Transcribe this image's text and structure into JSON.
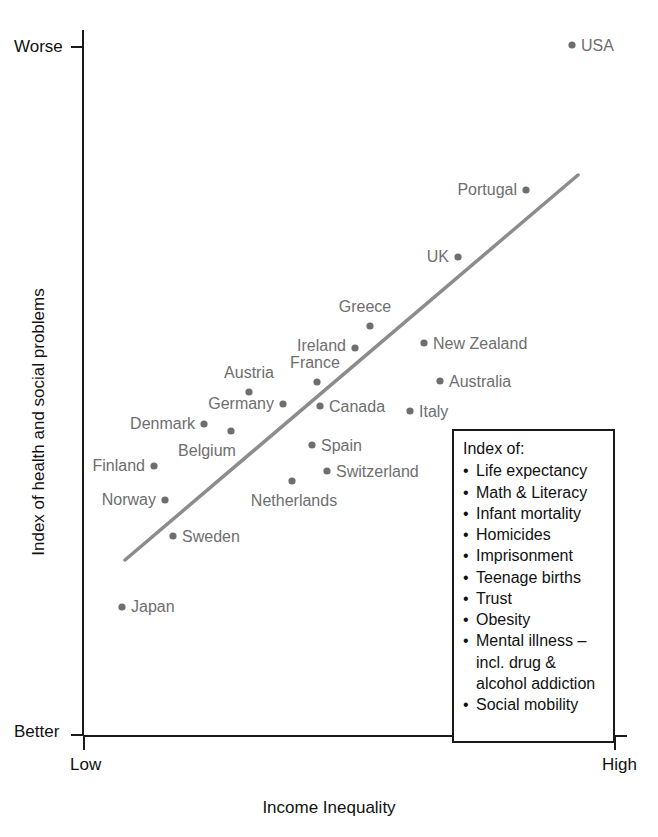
{
  "chart_data": {
    "type": "scatter",
    "title": "",
    "xlabel": "Income Inequality",
    "ylabel": "Index of health and social problems",
    "x_tick_labels": [
      "Low",
      "High"
    ],
    "y_tick_labels": [
      "Worse",
      "Better"
    ],
    "y_axis_top_label": "Worse",
    "y_axis_bottom_label": "Better",
    "grid": false,
    "legend_position": "inside-bottom-right",
    "point_color": "#6e6e6e",
    "trendline_color": "#8c8c8c",
    "axis_color": "#1a1a1a",
    "xlim": [
      0,
      1
    ],
    "ylim": [
      0,
      1
    ],
    "points": [
      {
        "name": "Japan",
        "x": 0.075,
        "y": 0.155,
        "px": 122,
        "py": 607,
        "label_anchor": "start",
        "label_dx": 9,
        "label_dy": 0
      },
      {
        "name": "Sweden",
        "x": 0.169,
        "y": 0.259,
        "px": 173,
        "py": 536,
        "label_anchor": "start",
        "label_dx": 9,
        "label_dy": 1
      },
      {
        "name": "Norway",
        "x": 0.153,
        "y": 0.312,
        "px": 165,
        "py": 500,
        "label_anchor": "end",
        "label_dx": -9,
        "label_dy": 0
      },
      {
        "name": "Finland",
        "x": 0.133,
        "y": 0.362,
        "px": 154,
        "py": 466,
        "label_anchor": "end",
        "label_dx": -9,
        "label_dy": 0
      },
      {
        "name": "Netherlands",
        "x": 0.389,
        "y": 0.34,
        "px": 292,
        "py": 481,
        "label_anchor": "middle",
        "label_dx": 2,
        "label_dy": 20
      },
      {
        "name": "Belgium",
        "x": 0.279,
        "y": 0.433,
        "px": 231,
        "py": 431,
        "label_anchor": "middle",
        "label_dx": -24,
        "label_dy": 20
      },
      {
        "name": "Denmark",
        "x": 0.229,
        "y": 0.443,
        "px": 204,
        "py": 424,
        "label_anchor": "end",
        "label_dx": -9,
        "label_dy": 0
      },
      {
        "name": "Switzerland",
        "x": 0.454,
        "y": 0.375,
        "px": 327,
        "py": 471,
        "label_anchor": "start",
        "label_dx": 9,
        "label_dy": 1
      },
      {
        "name": "Spain",
        "x": 0.426,
        "y": 0.413,
        "px": 312,
        "py": 445,
        "label_anchor": "start",
        "label_dx": 9,
        "label_dy": 1
      },
      {
        "name": "Germany",
        "x": 0.369,
        "y": 0.461,
        "px": 283,
        "py": 404,
        "label_anchor": "end",
        "label_dx": -9,
        "label_dy": 0
      },
      {
        "name": "Austria",
        "x": 0.306,
        "y": 0.478,
        "px": 249,
        "py": 392,
        "label_anchor": "middle",
        "label_dx": 0,
        "label_dy": -19
      },
      {
        "name": "Canada",
        "x": 0.437,
        "y": 0.458,
        "px": 320,
        "py": 406,
        "label_anchor": "start",
        "label_dx": 9,
        "label_dy": 1
      },
      {
        "name": "Italy",
        "x": 0.603,
        "y": 0.451,
        "px": 410,
        "py": 411,
        "label_anchor": "start",
        "label_dx": 9,
        "label_dy": 1
      },
      {
        "name": "France",
        "x": 0.432,
        "y": 0.494,
        "px": 317,
        "py": 382,
        "label_anchor": "middle",
        "label_dx": -2,
        "label_dy": -19
      },
      {
        "name": "Australia",
        "x": 0.658,
        "y": 0.496,
        "px": 440,
        "py": 381,
        "label_anchor": "start",
        "label_dx": 9,
        "label_dy": 1
      },
      {
        "name": "Ireland",
        "x": 0.501,
        "y": 0.545,
        "px": 355,
        "py": 348,
        "label_anchor": "end",
        "label_dx": -9,
        "label_dy": -2
      },
      {
        "name": "New Zealand",
        "x": 0.628,
        "y": 0.551,
        "px": 424,
        "py": 343,
        "label_anchor": "start",
        "label_dx": 9,
        "label_dy": 1
      },
      {
        "name": "Greece",
        "x": 0.529,
        "y": 0.577,
        "px": 370,
        "py": 326,
        "label_anchor": "middle",
        "label_dx": -5,
        "label_dy": -19
      },
      {
        "name": "UK",
        "x": 0.691,
        "y": 0.674,
        "px": 458,
        "py": 257,
        "label_anchor": "end",
        "label_dx": -9,
        "label_dy": 0
      },
      {
        "name": "Portugal",
        "x": 0.817,
        "y": 0.771,
        "px": 526,
        "py": 190,
        "label_anchor": "end",
        "label_dx": -9,
        "label_dy": 0
      },
      {
        "name": "USA",
        "x": 0.902,
        "y": 0.983,
        "px": 572,
        "py": 45,
        "label_anchor": "start",
        "label_dx": 9,
        "label_dy": 1
      }
    ],
    "trendline": {
      "x1": 125,
      "y1": 560,
      "x2": 578,
      "y2": 175
    }
  },
  "axes": {
    "y_top_label": "Worse",
    "y_bottom_label": "Better",
    "y_title": "Index of health and social problems",
    "x_left_label": "Low",
    "x_right_label": "High",
    "x_title": "Income Inequality"
  },
  "legend": {
    "title": "Index of:",
    "items": [
      "Life expectancy",
      "Math & Literacy",
      "Infant mortality",
      "Homicides",
      "Imprisonment",
      "Teenage births",
      "Trust",
      "Obesity",
      "Mental illness – incl. drug & alcohol addiction",
      "Social mobility"
    ]
  }
}
